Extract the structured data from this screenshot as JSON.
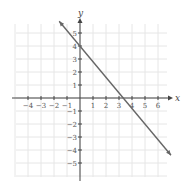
{
  "chart_data": {
    "type": "line",
    "title": "",
    "xlabel": "x",
    "ylabel": "y",
    "xlim": [
      -5,
      7
    ],
    "ylim": [
      -6,
      6
    ],
    "grid": true,
    "x_ticks": [
      -4,
      -3,
      -2,
      -1,
      1,
      2,
      3,
      4,
      5,
      6
    ],
    "y_ticks": [
      -5,
      -4,
      -3,
      -2,
      -1,
      1,
      2,
      3,
      4,
      5
    ],
    "x_tick_labels": [
      "−4",
      "−3",
      "−2",
      "−1",
      "1",
      "2",
      "3",
      "4",
      "5",
      "6"
    ],
    "y_tick_labels": [
      "−5",
      "−4",
      "−3",
      "−2",
      "−1",
      "1",
      "2",
      "3",
      "4",
      "5"
    ],
    "series": [
      {
        "name": "line",
        "equation": "y = -1.2x + 4",
        "points": [
          [
            -1.6,
            5.9
          ],
          [
            0,
            4
          ],
          [
            3.33,
            0
          ],
          [
            7,
            -4.4
          ]
        ],
        "arrows": "both",
        "color": "#666666"
      }
    ],
    "y_intercept": 4,
    "x_intercept": 3.33
  },
  "colors": {
    "grid": "#e6e6e6",
    "axis": "#444444",
    "line": "#666666"
  }
}
